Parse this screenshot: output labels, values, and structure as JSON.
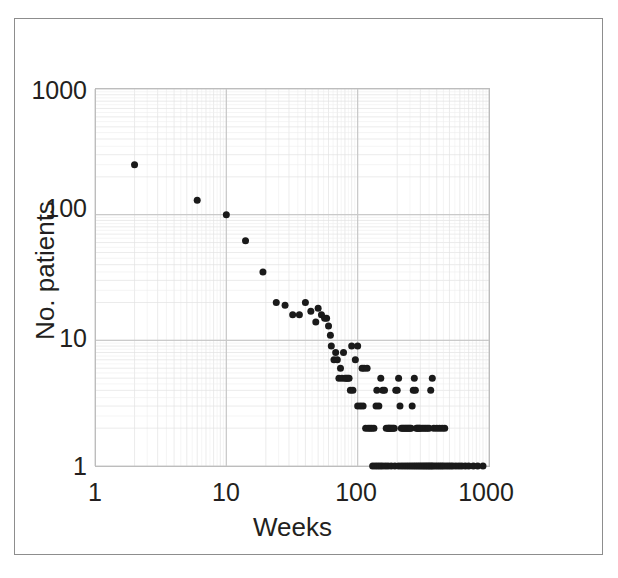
{
  "figure": {
    "clipped_caption_above": "",
    "border_color": "#8d8d8d",
    "background_color": "#ffffff"
  },
  "chart_data": {
    "type": "scatter",
    "title": "",
    "xlabel": "Weeks",
    "ylabel": "No. patients",
    "xscale": "log",
    "yscale": "log",
    "xlim": [
      1,
      1000
    ],
    "ylim": [
      1,
      1000
    ],
    "xticks": [
      1,
      10,
      100,
      1000
    ],
    "xtick_labels": [
      "1",
      "10",
      "100",
      "1000"
    ],
    "yticks": [
      1,
      10,
      100,
      1000
    ],
    "ytick_labels": [
      "1",
      "10",
      "100",
      "1000"
    ],
    "grid": true,
    "grid_minor": true,
    "grid_color": "#c9c9c9",
    "grid_minor_color": "#e2e2e2",
    "legend": "none",
    "marker": "circle",
    "marker_color": "#1a1a1a",
    "marker_size": 7,
    "points": [
      [
        2,
        250
      ],
      [
        6,
        130
      ],
      [
        10,
        100
      ],
      [
        14,
        62
      ],
      [
        19,
        35
      ],
      [
        24,
        20
      ],
      [
        28,
        19
      ],
      [
        32,
        16
      ],
      [
        36,
        16
      ],
      [
        40,
        20
      ],
      [
        44,
        17
      ],
      [
        48,
        14
      ],
      [
        50,
        18
      ],
      [
        53,
        16
      ],
      [
        56,
        15
      ],
      [
        58,
        15
      ],
      [
        60,
        13
      ],
      [
        63,
        9
      ],
      [
        66,
        7
      ],
      [
        70,
        7
      ],
      [
        72,
        5
      ],
      [
        74,
        6
      ],
      [
        76,
        5
      ],
      [
        78,
        8
      ],
      [
        80,
        5
      ],
      [
        82,
        5
      ],
      [
        84,
        5
      ],
      [
        86,
        5
      ],
      [
        90,
        9
      ],
      [
        96,
        7
      ],
      [
        100,
        3
      ],
      [
        105,
        3
      ],
      [
        110,
        3
      ],
      [
        115,
        2
      ],
      [
        120,
        2
      ],
      [
        124,
        2
      ],
      [
        128,
        2
      ],
      [
        133,
        2
      ],
      [
        138,
        3
      ],
      [
        140,
        4
      ],
      [
        145,
        3
      ],
      [
        150,
        5
      ],
      [
        155,
        4
      ],
      [
        160,
        4
      ],
      [
        165,
        2
      ],
      [
        170,
        2
      ],
      [
        172,
        2
      ],
      [
        175,
        2
      ],
      [
        178,
        2
      ],
      [
        182,
        2
      ],
      [
        186,
        2
      ],
      [
        190,
        2
      ],
      [
        195,
        4
      ],
      [
        200,
        4
      ],
      [
        205,
        5
      ],
      [
        210,
        3
      ],
      [
        215,
        2
      ],
      [
        220,
        2
      ],
      [
        225,
        2
      ],
      [
        230,
        2
      ],
      [
        235,
        2
      ],
      [
        240,
        2
      ],
      [
        245,
        2
      ],
      [
        250,
        2
      ],
      [
        255,
        2
      ],
      [
        260,
        3
      ],
      [
        265,
        4
      ],
      [
        270,
        5
      ],
      [
        275,
        4
      ],
      [
        280,
        2
      ],
      [
        285,
        2
      ],
      [
        290,
        2
      ],
      [
        295,
        2
      ],
      [
        300,
        2
      ],
      [
        310,
        2
      ],
      [
        320,
        2
      ],
      [
        330,
        2
      ],
      [
        340,
        2
      ],
      [
        350,
        2
      ],
      [
        360,
        4
      ],
      [
        370,
        5
      ],
      [
        380,
        2
      ],
      [
        400,
        2
      ],
      [
        420,
        2
      ],
      [
        440,
        2
      ],
      [
        460,
        2
      ],
      [
        130,
        1
      ],
      [
        136,
        1
      ],
      [
        142,
        1
      ],
      [
        148,
        1
      ],
      [
        154,
        1
      ],
      [
        162,
        1
      ],
      [
        170,
        1
      ],
      [
        180,
        1
      ],
      [
        192,
        1
      ],
      [
        205,
        1
      ],
      [
        215,
        1
      ],
      [
        225,
        1
      ],
      [
        235,
        1
      ],
      [
        245,
        1
      ],
      [
        255,
        1
      ],
      [
        265,
        1
      ],
      [
        275,
        1
      ],
      [
        285,
        1
      ],
      [
        295,
        1
      ],
      [
        305,
        1
      ],
      [
        315,
        1
      ],
      [
        325,
        1
      ],
      [
        335,
        1
      ],
      [
        345,
        1
      ],
      [
        355,
        1
      ],
      [
        365,
        1
      ],
      [
        375,
        1
      ],
      [
        390,
        1
      ],
      [
        405,
        1
      ],
      [
        420,
        1
      ],
      [
        435,
        1
      ],
      [
        450,
        1
      ],
      [
        470,
        1
      ],
      [
        490,
        1
      ],
      [
        510,
        1
      ],
      [
        530,
        1
      ],
      [
        560,
        1
      ],
      [
        590,
        1
      ],
      [
        620,
        1
      ],
      [
        660,
        1
      ],
      [
        700,
        1
      ],
      [
        760,
        1
      ],
      [
        820,
        1
      ],
      [
        900,
        1
      ],
      [
        100,
        9
      ],
      [
        108,
        6
      ],
      [
        112,
        6
      ],
      [
        118,
        6
      ],
      [
        62,
        11
      ],
      [
        68,
        8
      ],
      [
        88,
        4
      ],
      [
        92,
        4
      ]
    ]
  }
}
